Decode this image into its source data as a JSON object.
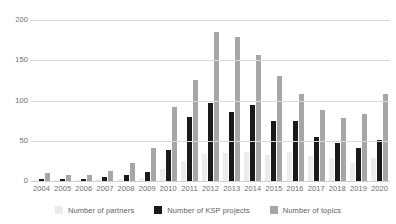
{
  "chart_data": {
    "type": "bar",
    "title": "",
    "subtitle": "",
    "xlabel": "",
    "ylabel": "",
    "ylim": [
      0,
      200
    ],
    "yticks": [
      0,
      50,
      100,
      150,
      200
    ],
    "grid": true,
    "legend_position": "bottom",
    "categories": [
      "2004",
      "2005",
      "2006",
      "2007",
      "2008",
      "2009",
      "2010",
      "2011",
      "2012",
      "2013",
      "2014",
      "2015",
      "2016",
      "2017",
      "2018",
      "2019",
      "2020"
    ],
    "series": [
      {
        "name": "Number of partners",
        "color": "#ececec",
        "values": [
          1,
          1,
          1,
          2,
          3,
          4,
          15,
          25,
          33,
          35,
          36,
          32,
          36,
          31,
          29,
          23,
          29
        ]
      },
      {
        "name": "Number of KSP projects",
        "color": "#1a1a1a",
        "values": [
          2,
          2,
          3,
          5,
          8,
          11,
          38,
          80,
          97,
          86,
          95,
          75,
          75,
          55,
          47,
          41,
          51
        ]
      },
      {
        "name": "Number of topics",
        "color": "#a6a6a6",
        "values": [
          10,
          8,
          7,
          12,
          23,
          41,
          92,
          125,
          185,
          179,
          157,
          130,
          108,
          88,
          78,
          83,
          108
        ]
      }
    ]
  },
  "legend": {
    "items": [
      {
        "label": "Number of partners"
      },
      {
        "label": "Number of KSP projects"
      },
      {
        "label": "Number of topics"
      }
    ]
  }
}
